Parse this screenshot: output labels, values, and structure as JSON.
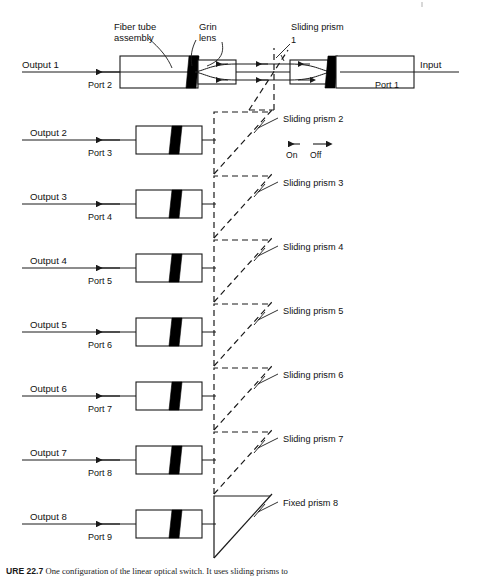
{
  "figure": {
    "title": "One configuration of the linear optical switch",
    "caption_prefix": "URE 22.7",
    "caption_text": "One configuration of the linear optical switch. It uses sliding prisms to"
  },
  "annotations": {
    "fiber_tube_line1": "Fiber tube",
    "fiber_tube_line2": "assembly",
    "grin_lens_line1": "Grin",
    "grin_lens_line2": "lens",
    "input": "Input",
    "on": "On",
    "off": "Off"
  },
  "colors": {
    "line": "#1a1a1a",
    "grin_lens": "#000000",
    "background": "#ffffff",
    "dashed": "#1a1a1a"
  },
  "rows": [
    {
      "index": 1,
      "output_label": "Output 1",
      "port_label": "Port 2",
      "right_port_label": "Port 1",
      "prism_label": "Sliding prism",
      "prism_number": "1",
      "prism_type": "sliding",
      "axis_y": 72,
      "has_right_assembly": true
    },
    {
      "index": 2,
      "output_label": "Output 2",
      "port_label": "Port 3",
      "prism_label": "Sliding prism 2",
      "prism_type": "sliding",
      "axis_y": 140,
      "has_right_assembly": false
    },
    {
      "index": 3,
      "output_label": "Output 3",
      "port_label": "Port 4",
      "prism_label": "Sliding prism 3",
      "prism_type": "sliding",
      "axis_y": 204,
      "has_right_assembly": false
    },
    {
      "index": 4,
      "output_label": "Output 4",
      "port_label": "Port 5",
      "prism_label": "Sliding prism 4",
      "prism_type": "sliding",
      "axis_y": 268,
      "has_right_assembly": false
    },
    {
      "index": 5,
      "output_label": "Output 5",
      "port_label": "Port 6",
      "prism_label": "Sliding prism 5",
      "prism_type": "sliding",
      "axis_y": 332,
      "has_right_assembly": false
    },
    {
      "index": 6,
      "output_label": "Output 6",
      "port_label": "Port 7",
      "prism_label": "Sliding prism 6",
      "prism_type": "sliding",
      "axis_y": 396,
      "has_right_assembly": false
    },
    {
      "index": 7,
      "output_label": "Output 7",
      "port_label": "Port 8",
      "prism_label": "Sliding prism 7",
      "prism_type": "sliding",
      "axis_y": 460,
      "has_right_assembly": false
    },
    {
      "index": 8,
      "output_label": "Output 8",
      "port_label": "Port 9",
      "prism_label": "Fixed prism 8",
      "prism_type": "fixed",
      "axis_y": 524,
      "has_right_assembly": false
    }
  ]
}
